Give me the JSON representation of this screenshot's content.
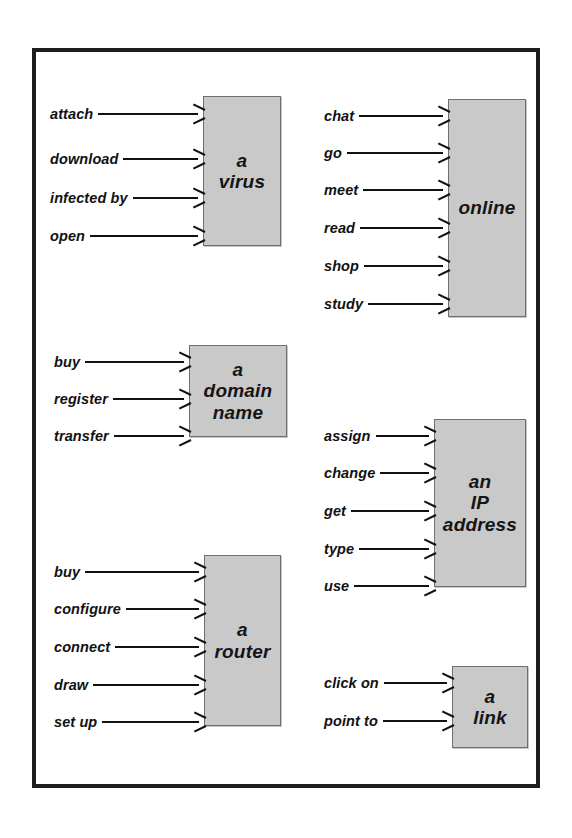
{
  "page": {
    "background_color": "#ffffff",
    "frame_color": "#1d1d1d",
    "box_fill_color": "#c9c9c9",
    "box_border_color": "#6f6f6f",
    "text_color": "#111111"
  },
  "clusters": [
    {
      "id": "virus",
      "target": "a\nvirus",
      "collocates": [
        "attach",
        "download",
        "infected by",
        "open"
      ]
    },
    {
      "id": "online",
      "target": "online",
      "collocates": [
        "chat",
        "go",
        "meet",
        "read",
        "shop",
        "study"
      ]
    },
    {
      "id": "domain-name",
      "target": "a\ndomain\nname",
      "collocates": [
        "buy",
        "register",
        "transfer"
      ]
    },
    {
      "id": "ip-address",
      "target": "an\nIP\naddress",
      "collocates": [
        "assign",
        "change",
        "get",
        "type",
        "use"
      ]
    },
    {
      "id": "router",
      "target": "a\nrouter",
      "collocates": [
        "buy",
        "configure",
        "connect",
        "draw",
        "set up"
      ]
    },
    {
      "id": "link",
      "target": "a\nlink",
      "collocates": [
        "click on",
        "point to"
      ]
    }
  ]
}
